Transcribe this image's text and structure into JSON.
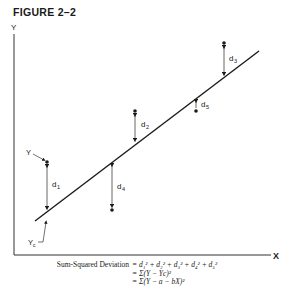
{
  "figure": {
    "title": "FIGURE 2–2",
    "axes": {
      "y_label": "Y",
      "x_label": "X"
    },
    "regression_line_label": "",
    "annotations": {
      "observed_point_label": "Y",
      "computed_point_label": "Y",
      "computed_point_subscript": "c"
    },
    "deviations": [
      {
        "name": "d",
        "sub": "1"
      },
      {
        "name": "d",
        "sub": "2"
      },
      {
        "name": "d",
        "sub": "3"
      },
      {
        "name": "d",
        "sub": "4"
      },
      {
        "name": "d",
        "sub": "5"
      }
    ],
    "formula": {
      "lhs": "Sum-Squared Deviation",
      "lines": [
        "= d₁² + d₂² + d₃² + d₄² + d₅²",
        "= Σ(Y − Yc)²",
        "= Σ(Y − a − bX)²"
      ]
    }
  },
  "colors": {
    "ink": "#1a1a1a",
    "background": "#ffffff"
  }
}
